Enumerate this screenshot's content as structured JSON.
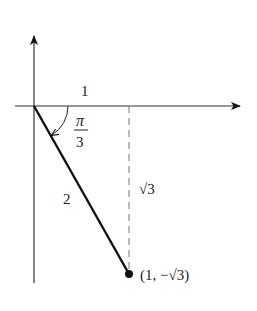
{
  "diagram": {
    "type": "unit-triangle-angle",
    "labels": {
      "adjacent": "1",
      "hypotenuse": "2",
      "opposite": "√3",
      "angle_num": "π",
      "angle_den": "3",
      "point": "(1, −√3)"
    },
    "colors": {
      "ink": "#111111",
      "dashed": "#777777",
      "background": "#ffffff"
    }
  }
}
